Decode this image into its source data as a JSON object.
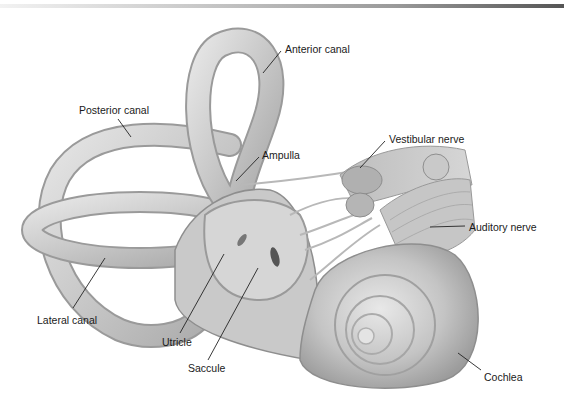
{
  "figure": {
    "labels": [
      {
        "id": "anterior-canal",
        "text": "Anterior canal",
        "x": 285,
        "y": 43
      },
      {
        "id": "posterior-canal",
        "text": "Posterior canal",
        "x": 79,
        "y": 104
      },
      {
        "id": "ampulla",
        "text": "Ampulla",
        "x": 262,
        "y": 149
      },
      {
        "id": "vestibular-nerve",
        "text": "Vestibular nerve",
        "x": 389,
        "y": 133
      },
      {
        "id": "auditory-nerve",
        "text": "Auditory nerve",
        "x": 469,
        "y": 221
      },
      {
        "id": "lateral-canal",
        "text": "Lateral canal",
        "x": 37,
        "y": 314
      },
      {
        "id": "utricle",
        "text": "Utricle",
        "x": 162,
        "y": 336
      },
      {
        "id": "saccule",
        "text": "Saccule",
        "x": 188,
        "y": 362
      },
      {
        "id": "cochlea",
        "text": "Cochlea",
        "x": 484,
        "y": 371
      }
    ]
  }
}
